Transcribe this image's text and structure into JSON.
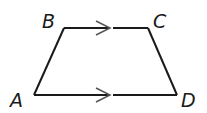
{
  "figure": {
    "shape": "trapezoid",
    "labels": {
      "B": "B",
      "C": "C",
      "A": "A",
      "D": "D"
    },
    "vertices": {
      "A": [
        34,
        95
      ],
      "B": [
        64,
        28
      ],
      "C": [
        148,
        28
      ],
      "D": [
        177,
        95
      ]
    },
    "parallel_marks": [
      {
        "segment": "BC",
        "direction": "right"
      },
      {
        "segment": "AD",
        "direction": "right"
      }
    ],
    "colors": {
      "stroke": "#1a1a1a",
      "mark": "#555555",
      "background": "#ffffff"
    }
  }
}
